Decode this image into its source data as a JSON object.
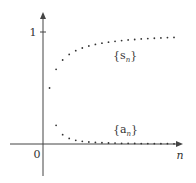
{
  "chart_data": {
    "type": "scatter",
    "title": "",
    "xlabel": "n",
    "ylabel": "",
    "origin_label": "0",
    "y_ticks": [
      {
        "value": 1,
        "label": "1"
      }
    ],
    "xlim": [
      0,
      20
    ],
    "ylim": [
      -0.3,
      1.2
    ],
    "grid": false,
    "series": [
      {
        "name": "{s_n}",
        "label_main": "{s",
        "label_sub": "n",
        "label_close": "}",
        "x": [
          1,
          2,
          3,
          4,
          5,
          6,
          7,
          8,
          9,
          10,
          11,
          12,
          13,
          14,
          15,
          16,
          17,
          18,
          19,
          20
        ],
        "values": [
          0.5,
          0.667,
          0.75,
          0.8,
          0.833,
          0.857,
          0.875,
          0.889,
          0.9,
          0.909,
          0.917,
          0.923,
          0.929,
          0.933,
          0.938,
          0.941,
          0.944,
          0.947,
          0.95,
          0.952
        ]
      },
      {
        "name": "{a_n}",
        "label_main": "{a",
        "label_sub": "n",
        "label_close": "}",
        "x": [
          2,
          3,
          4,
          5,
          6,
          7,
          8,
          9,
          10,
          11,
          12,
          13,
          14,
          15,
          16,
          17,
          18,
          19,
          20
        ],
        "values": [
          0.167,
          0.083,
          0.05,
          0.033,
          0.024,
          0.018,
          0.014,
          0.011,
          0.009,
          0.008,
          0.006,
          0.006,
          0.005,
          0.004,
          0.004,
          0.003,
          0.003,
          0.003,
          0.002
        ]
      }
    ]
  }
}
